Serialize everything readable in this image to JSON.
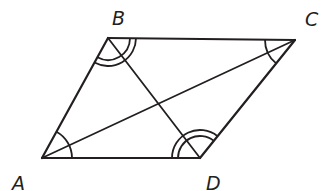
{
  "figure": {
    "type": "parallelogram-with-diagonals",
    "stroke_color": "#231f20",
    "background": "#ffffff",
    "vertices": [
      {
        "id": "A",
        "label": "A",
        "x": 42,
        "y": 158,
        "label_x": 12,
        "label_y": 190
      },
      {
        "id": "B",
        "label": "B",
        "x": 108,
        "y": 38,
        "label_x": 112,
        "label_y": 25
      },
      {
        "id": "C",
        "label": "C",
        "x": 295,
        "y": 40,
        "label_x": 305,
        "label_y": 26
      },
      {
        "id": "D",
        "label": "D",
        "x": 200,
        "y": 158,
        "label_x": 206,
        "label_y": 190
      }
    ],
    "sides": [
      {
        "from": "A",
        "to": "B"
      },
      {
        "from": "B",
        "to": "C"
      },
      {
        "from": "C",
        "to": "D"
      },
      {
        "from": "D",
        "to": "A"
      }
    ],
    "diagonals": [
      {
        "from": "A",
        "to": "C"
      },
      {
        "from": "B",
        "to": "D"
      }
    ],
    "angle_marks": [
      {
        "vertex": "A",
        "arcs": 1,
        "radius": 30
      },
      {
        "vertex": "C",
        "arcs": 1,
        "radius": 30
      },
      {
        "vertex": "B",
        "arcs": 2,
        "radius": 22,
        "gap": 6
      },
      {
        "vertex": "D",
        "arcs": 2,
        "radius": 22,
        "gap": 6
      }
    ]
  }
}
